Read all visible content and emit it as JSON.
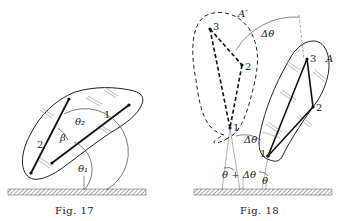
{
  "figures": [
    {
      "caption": "Fig. 17",
      "labels": {
        "line_1": "1",
        "line_2": "2",
        "theta_1": "θ₁",
        "theta_2": "θ₂",
        "beta": "β"
      }
    },
    {
      "caption": "Fig. 18",
      "labels": {
        "body_A": "A",
        "body_A_prime": "A′",
        "point_1": "1",
        "point_2": "2",
        "point_3": "3",
        "point_1_prime": "1",
        "point_2_prime": "2",
        "point_3_prime": "3",
        "delta_theta_top": "Δθ",
        "delta_theta_mid": "Δθ",
        "theta": "θ",
        "theta_plus_delta": "θ + Δθ"
      }
    }
  ],
  "colors": {
    "ink": "#222222",
    "hatch": "#999999",
    "background": "#ffffff"
  }
}
